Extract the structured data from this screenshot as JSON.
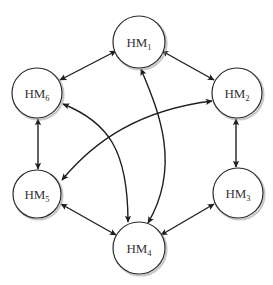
{
  "diagram": {
    "type": "bidirectional-network",
    "width": 273,
    "height": 285,
    "colors": {
      "background": "#ffffff",
      "node_fill": "#ffffff",
      "node_stroke": "#2a2a2a",
      "edge": "#1f1f1f",
      "label": "#333333"
    },
    "nodes": [
      {
        "id": "HM1",
        "base": "HM",
        "sub": "1",
        "cx": 139,
        "cy": 42,
        "r": 26
      },
      {
        "id": "HM2",
        "base": "HM",
        "sub": "2",
        "cx": 237,
        "cy": 93,
        "r": 25
      },
      {
        "id": "HM3",
        "base": "HM",
        "sub": "3",
        "cx": 238,
        "cy": 193,
        "r": 25
      },
      {
        "id": "HM4",
        "base": "HM",
        "sub": "4",
        "cx": 139,
        "cy": 248,
        "r": 26
      },
      {
        "id": "HM5",
        "base": "HM",
        "sub": "5",
        "cx": 37,
        "cy": 194,
        "r": 24
      },
      {
        "id": "HM6",
        "base": "HM",
        "sub": "6",
        "cx": 37,
        "cy": 93,
        "r": 25
      }
    ],
    "edges": [
      {
        "from": "HM1",
        "to": "HM2",
        "direction": "both",
        "shape": "straight"
      },
      {
        "from": "HM1",
        "to": "HM6",
        "direction": "both",
        "shape": "straight"
      },
      {
        "from": "HM2",
        "to": "HM3",
        "direction": "both",
        "shape": "straight"
      },
      {
        "from": "HM6",
        "to": "HM5",
        "direction": "both",
        "shape": "straight"
      },
      {
        "from": "HM5",
        "to": "HM4",
        "direction": "both",
        "shape": "straight"
      },
      {
        "from": "HM3",
        "to": "HM4",
        "direction": "both",
        "shape": "straight"
      },
      {
        "from": "HM1",
        "to": "HM4",
        "direction": "both",
        "shape": "curved"
      },
      {
        "from": "HM6",
        "to": "HM4",
        "direction": "both",
        "shape": "curved"
      },
      {
        "from": "HM2",
        "to": "HM5",
        "direction": "both",
        "shape": "curved"
      }
    ]
  }
}
